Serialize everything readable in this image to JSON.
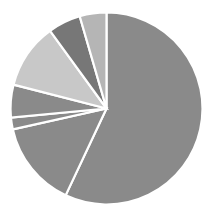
{
  "chart_data": {
    "type": "pie",
    "title": "",
    "subtitle": "",
    "xlabel": "",
    "ylabel": "",
    "grid": false,
    "legend": "none",
    "labels_shown": false,
    "start_angle_deg": 0,
    "direction": "clockwise",
    "center_x": 106.5,
    "center_y": 108.5,
    "radius": 96,
    "categories": [
      "Slice 1",
      "Slice 2",
      "Slice 3",
      "Slice 4",
      "Slice 5",
      "Slice 6",
      "Slice 7"
    ],
    "values": [
      57.0,
      14.5,
      2.0,
      5.5,
      11.0,
      5.5,
      4.5
    ],
    "percentages": [
      57.0,
      14.5,
      2.0,
      5.5,
      11.0,
      5.5,
      4.5
    ],
    "angles_deg": [
      205.2,
      52.2,
      7.2,
      19.8,
      39.6,
      19.8,
      16.2
    ],
    "colors": [
      "#8a8a8a",
      "#8a8a8a",
      "#8a8a8a",
      "#8a8a8a",
      "#c8c8c8",
      "#777777",
      "#b5b5b5"
    ],
    "slice_separator_color": "#ffffff",
    "background_color": "#ffffff"
  },
  "figure": {
    "width": 212,
    "height": 220
  }
}
